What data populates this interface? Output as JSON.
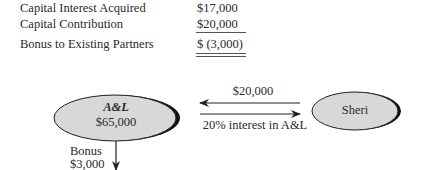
{
  "table": {
    "rows": [
      {
        "label": "Capital Interest Acquired",
        "value": "$17,000"
      },
      {
        "label": "Capital Contribution",
        "value": "$20,000"
      },
      {
        "label": "Bonus to Existing Partners",
        "value": "$ (3,000)"
      }
    ]
  },
  "diagram": {
    "left_node": {
      "title": "A&L",
      "amount": "$65,000"
    },
    "right_node": {
      "title": "Sheri"
    },
    "top_arrow_label": "$20,000",
    "bottom_arrow_label": "20% interest in A&L",
    "down_arrow_label": [
      "Bonus",
      "$3,000"
    ],
    "colors": {
      "node_fill": "#d8d8d8",
      "node_shadow": "#111111",
      "stroke": "#222222"
    }
  }
}
